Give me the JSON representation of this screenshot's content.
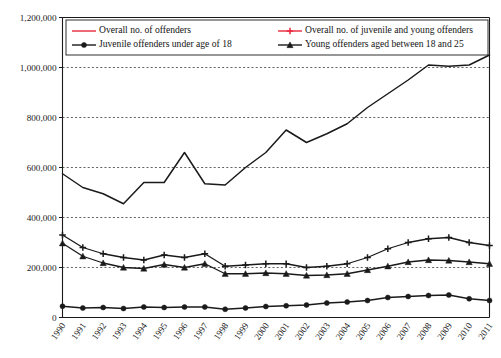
{
  "chart_data": {
    "type": "line",
    "title": "",
    "xlabel": "",
    "ylabel": "",
    "ylim": [
      0,
      1200000
    ],
    "grid": true,
    "legend_position": "top-inside",
    "categories": [
      "1990",
      "1991",
      "1992",
      "1993",
      "1994",
      "1995",
      "1996",
      "1997",
      "1998",
      "1999",
      "2000",
      "2001",
      "2002",
      "2003",
      "2004",
      "2005",
      "2006",
      "2007",
      "2008",
      "2009",
      "2010",
      "2011"
    ],
    "ytick_labels": [
      "0",
      "200,000",
      "400,000",
      "600,000",
      "800,000",
      "1,000,000",
      "1,200,000"
    ],
    "ytick_values": [
      0,
      200000,
      400000,
      600000,
      800000,
      1000000,
      1200000
    ],
    "series": [
      {
        "name": "Overall no. of offenders",
        "color": "#1a1a1a",
        "legend_color": "#e8283c",
        "marker": "none",
        "values": [
          575000,
          520000,
          495000,
          455000,
          540000,
          540000,
          660000,
          535000,
          530000,
          600000,
          660000,
          750000,
          700000,
          735000,
          775000,
          840000,
          895000,
          950000,
          1010000,
          1005000,
          1010000,
          1050000
        ]
      },
      {
        "name": "Overall no. of juvenile and young offenders",
        "color": "#1a1a1a",
        "legend_color": "#e8283c",
        "marker": "plus",
        "values": [
          330000,
          280000,
          255000,
          240000,
          230000,
          250000,
          240000,
          255000,
          205000,
          210000,
          215000,
          215000,
          200000,
          205000,
          215000,
          240000,
          275000,
          300000,
          315000,
          320000,
          300000,
          288000
        ]
      },
      {
        "name": "Juvenile offenders under age of 18",
        "color": "#1a1a1a",
        "legend_color": "#1a1a1a",
        "marker": "circle",
        "values": [
          45000,
          38000,
          40000,
          36000,
          42000,
          40000,
          42000,
          42000,
          33000,
          38000,
          44000,
          47000,
          50000,
          58000,
          62000,
          68000,
          80000,
          84000,
          88000,
          90000,
          75000,
          68000
        ]
      },
      {
        "name": "Young offenders aged between 18 and 25",
        "color": "#1a1a1a",
        "legend_color": "#1a1a1a",
        "marker": "triangle",
        "values": [
          297000,
          245000,
          218000,
          200000,
          196000,
          212000,
          200000,
          215000,
          175000,
          175000,
          178000,
          175000,
          168000,
          170000,
          175000,
          190000,
          205000,
          222000,
          230000,
          228000,
          222000,
          215000
        ]
      }
    ],
    "legend": [
      {
        "label": "Overall no. of offenders",
        "color": "#e8283c",
        "marker": "none"
      },
      {
        "label": "Overall no. of juvenile and young offenders",
        "color": "#e8283c",
        "marker": "plus"
      },
      {
        "label": "Juvenile offenders under age of 18",
        "color": "#1a1a1a",
        "marker": "circle"
      },
      {
        "label": "Young offenders aged between 18 and 25",
        "color": "#1a1a1a",
        "marker": "triangle"
      }
    ]
  }
}
